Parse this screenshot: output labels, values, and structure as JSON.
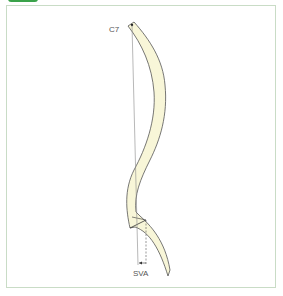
{
  "figure": {
    "labels": {
      "top_vertebra": "C7",
      "measurement": "SVA"
    },
    "colors": {
      "tab": "#3aa24a",
      "frame_border": "#c9dcc6",
      "spine_fill": "#f8f6d8",
      "spine_stroke": "#555555",
      "plumb_line": "#888888"
    }
  }
}
